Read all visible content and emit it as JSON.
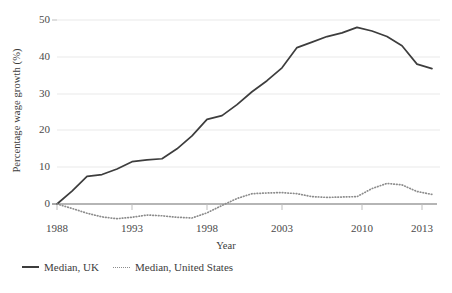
{
  "chart_data": {
    "type": "line",
    "title": "",
    "xlabel": "Year",
    "ylabel": "Percentage wage growth (%)",
    "xlim": [
      1988,
      2013
    ],
    "ylim": [
      -5,
      52
    ],
    "yticks": [
      0,
      10,
      20,
      30,
      40,
      50
    ],
    "xticks": [
      1988,
      1993,
      1998,
      2003,
      2010,
      2013
    ],
    "grid": "horizontal",
    "legend_position": "below-left",
    "x": [
      1988,
      1989,
      1990,
      1991,
      1992,
      1993,
      1994,
      1995,
      1996,
      1997,
      1998,
      1999,
      2000,
      2001,
      2002,
      2003,
      2004,
      2005,
      2006,
      2007,
      2008,
      2009,
      2010,
      2011,
      2012,
      2013
    ],
    "series": [
      {
        "name": "Median, UK",
        "style": "solid",
        "color": "#3d3d3d",
        "values": [
          0,
          3.5,
          7.5,
          8.0,
          9.5,
          11.5,
          12.0,
          12.3,
          15.0,
          18.5,
          23.0,
          24.0,
          27.0,
          30.5,
          33.5,
          37.0,
          42.5,
          44.0,
          45.5,
          46.5,
          48.0,
          47.0,
          45.5,
          43.0,
          38.0,
          36.8
        ]
      },
      {
        "name": "Median, United States",
        "style": "dotted",
        "color": "#8c8c8c",
        "values": [
          0,
          -1.2,
          -2.5,
          -3.5,
          -4.0,
          -3.6,
          -3.0,
          -3.2,
          -3.6,
          -3.8,
          -2.4,
          -0.4,
          1.5,
          2.8,
          3.0,
          3.1,
          2.8,
          2.0,
          1.8,
          1.9,
          2.0,
          4.2,
          5.6,
          5.2,
          3.4,
          2.6
        ]
      }
    ],
    "series_end_values": {
      "uk_final": 36.8,
      "us_final": 1.0
    }
  },
  "legend": {
    "items": [
      {
        "label": "Median, UK",
        "style": "solid"
      },
      {
        "label": "Median, United States",
        "style": "dotted"
      }
    ]
  },
  "axes": {
    "y_tick_labels": [
      "50",
      "40",
      "30",
      "20",
      "10",
      "0"
    ],
    "x_tick_labels": [
      "1988",
      "1993",
      "1998",
      "2003",
      "2010",
      "2013"
    ],
    "y_title": "Percentage wage growth (%)",
    "x_title": "Year"
  }
}
